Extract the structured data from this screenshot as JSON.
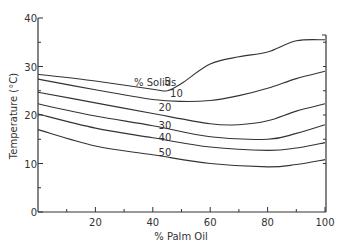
{
  "chart_data": {
    "type": "line",
    "title": "",
    "xlabel": "% Palm Oil",
    "ylabel": "Temperature (°C)",
    "xlim": [
      0,
      100
    ],
    "ylim": [
      0,
      40
    ],
    "x_ticks": [
      20,
      40,
      60,
      80,
      100
    ],
    "x_tick_labels": [
      "20",
      "40",
      "60",
      "80",
      "100"
    ],
    "x_minor_ticks": [
      10,
      30,
      50,
      70,
      90
    ],
    "y_ticks": [
      0,
      10,
      20,
      30,
      40
    ],
    "y_tick_labels": [
      "0",
      "10",
      "20",
      "30",
      "40"
    ],
    "y_minor_ticks": [
      5,
      15,
      25,
      35
    ],
    "grid": false,
    "legend": "inline curve labels",
    "series_title": "% Solids",
    "series": [
      {
        "name": "5",
        "x": [
          0,
          20,
          40,
          45,
          50,
          60,
          70,
          80,
          90,
          100
        ],
        "values": [
          28.4,
          27.0,
          25.3,
          25.0,
          26.5,
          30.5,
          32.0,
          33.0,
          35.3,
          35.5
        ],
        "label_pos": [
          44,
          26.2
        ]
      },
      {
        "name": "10",
        "x": [
          0,
          20,
          40,
          50,
          60,
          70,
          80,
          90,
          100
        ],
        "values": [
          27.4,
          25.2,
          23.2,
          22.8,
          23.0,
          24.0,
          25.5,
          27.5,
          29.0
        ],
        "label_pos": [
          46,
          23.8
        ]
      },
      {
        "name": "20",
        "x": [
          0,
          20,
          40,
          60,
          70,
          80,
          90,
          100
        ],
        "values": [
          24.7,
          22.5,
          20.3,
          18.2,
          18.0,
          18.8,
          20.8,
          22.3
        ],
        "label_pos": [
          42,
          20.8
        ]
      },
      {
        "name": "30",
        "x": [
          0,
          20,
          40,
          60,
          80,
          90,
          100
        ],
        "values": [
          22.3,
          19.8,
          17.8,
          15.5,
          15.0,
          16.2,
          18.0
        ],
        "label_pos": [
          42,
          17.2
        ]
      },
      {
        "name": "40",
        "x": [
          0,
          20,
          40,
          60,
          80,
          90,
          100
        ],
        "values": [
          20.2,
          17.3,
          15.3,
          13.4,
          12.7,
          13.2,
          14.3
        ],
        "label_pos": [
          42,
          14.7
        ]
      },
      {
        "name": "50",
        "x": [
          0,
          20,
          40,
          60,
          80,
          90,
          100
        ],
        "values": [
          17.0,
          13.6,
          11.8,
          10.0,
          9.3,
          9.8,
          10.8
        ],
        "label_pos": [
          42,
          11.6
        ]
      }
    ],
    "line_color": "#333333",
    "right_axis": true
  },
  "plot_area": {
    "x0": 38,
    "x1": 325,
    "y0": 212,
    "y1": 18
  }
}
